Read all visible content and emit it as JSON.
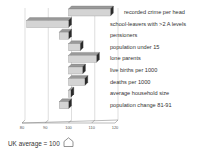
{
  "chart_data": {
    "type": "bar",
    "orientation": "horizontal",
    "style": "3d",
    "title": "",
    "xlabel": "",
    "ylabel": "",
    "baseline": 100,
    "xlim": [
      80,
      120
    ],
    "x_ticks": [
      80,
      90,
      100,
      110,
      120
    ],
    "grid": true,
    "categories": [
      "recorded crime per head",
      "school-leavers with >2 A levels",
      "pensioners",
      "population under 15",
      "lone parents",
      "live births per 1000",
      "deaths per 1000",
      "average household size",
      "population change 81-91"
    ],
    "values": [
      118,
      82,
      96,
      105,
      112,
      106,
      107,
      101,
      96
    ],
    "annotation": "UK average = 100",
    "colors": {
      "front": "#d4d4d4",
      "top": "#9a9a9a",
      "side": "#2a2a2a",
      "grid": "#bdbdbd"
    }
  },
  "footer": {
    "text": "UK average = 100"
  }
}
